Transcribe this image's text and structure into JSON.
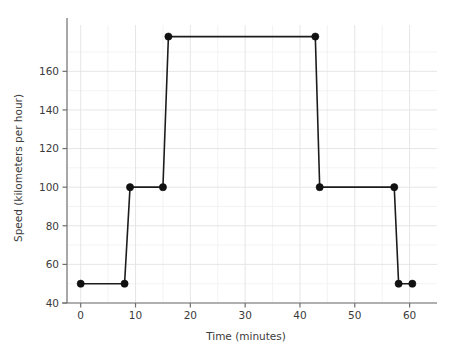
{
  "chart_data": {
    "type": "line",
    "title": "",
    "xlabel": "Time (minutes)",
    "ylabel": "Speed (kilometers per hour)",
    "xlim": [
      -2.5,
      65
    ],
    "ylim": [
      40,
      184
    ],
    "grid": true,
    "legend": null,
    "marker": "circle",
    "line_color": "#1c1c1c",
    "x": [
      0,
      8,
      9,
      15,
      16,
      42.8,
      43.6,
      57.2,
      58,
      60.5
    ],
    "y": [
      50,
      50,
      100,
      100,
      178,
      178,
      100,
      100,
      50,
      50
    ],
    "points": [
      {
        "x": 0,
        "y": 50
      },
      {
        "x": 8,
        "y": 50
      },
      {
        "x": 9,
        "y": 100
      },
      {
        "x": 15,
        "y": 100
      },
      {
        "x": 16,
        "y": 178
      },
      {
        "x": 42.8,
        "y": 178
      },
      {
        "x": 43.6,
        "y": 100
      },
      {
        "x": 57.2,
        "y": 100
      },
      {
        "x": 58,
        "y": 50
      },
      {
        "x": 60.5,
        "y": 50
      }
    ],
    "xticks": [
      0,
      10,
      20,
      30,
      40,
      50,
      60
    ],
    "xticklabels": [
      "0",
      "10",
      "20",
      "30",
      "40",
      "50",
      "60"
    ],
    "yticks": [
      40,
      60,
      80,
      100,
      120,
      140,
      160
    ],
    "yticklabels": [
      "40",
      "60",
      "80",
      "100",
      "120",
      "140",
      "160"
    ],
    "y_minor_ticks": [
      50,
      70,
      90,
      110,
      130,
      150,
      170
    ],
    "x_minor_ticks": [
      5,
      15,
      25,
      35,
      45,
      55
    ],
    "colors": {
      "line": "#1c1c1c",
      "marker": "#111111",
      "grid_major": "#e3e3e6",
      "grid_minor": "#f0f0f2",
      "spine": "#6e6e6e",
      "text": "#3b3b3b",
      "background": "#ffffff"
    }
  }
}
